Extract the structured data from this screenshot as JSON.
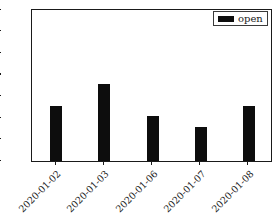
{
  "chart_data": {
    "type": "bar",
    "title": "",
    "xlabel": "",
    "ylabel": "",
    "categories": [
      "2020-01-02",
      "2020-01-03",
      "2020-01-06",
      "2020-01-07",
      "2020-01-08"
    ],
    "series": [
      {
        "name": "open",
        "values": [
          3.709,
          3.73,
          3.7,
          3.69,
          3.709
        ]
      }
    ],
    "ylim": [
      3.6585,
      3.8
    ],
    "yticks": [
      "3.66",
      "3.68",
      "3.70",
      "3.72",
      "3.74",
      "3.76",
      "3.78",
      "3.80"
    ],
    "ytick_values": [
      3.66,
      3.68,
      3.7,
      3.72,
      3.74,
      3.76,
      3.78,
      3.8
    ],
    "grid": false,
    "legend": {
      "position": "upper right",
      "entries": [
        "open"
      ]
    },
    "bar_color": "#0d0d0d",
    "axis_color": "#1a1a1a",
    "background": "#ffffff"
  }
}
